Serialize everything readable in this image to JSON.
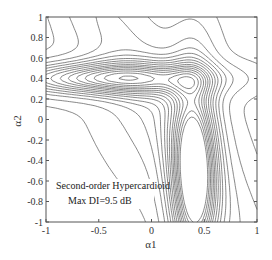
{
  "chart_data": {
    "type": "contour",
    "title": "",
    "xlabel": "α1",
    "ylabel": "α2",
    "xlim": [
      -1,
      1
    ],
    "ylim": [
      -1,
      1
    ],
    "xticks": [
      "-1",
      "-0.5",
      "0",
      "0.5",
      "1"
    ],
    "yticks": [
      "-1",
      "-0.8",
      "-0.6",
      "-0.4",
      "-0.2",
      "0",
      "0.2",
      "0.4",
      "0.6",
      "0.8",
      "1"
    ],
    "grid": false,
    "annotations": [
      {
        "text": "Second-order Hypercardioid",
        "x": -0.55,
        "y": -0.7
      },
      {
        "text": "Max DI=9.5 dB",
        "x": -0.55,
        "y": -0.88
      }
    ],
    "max_value_db": 9.5,
    "maximum_location": {
      "alpha1": 0.4,
      "alpha2": -0.6
    },
    "secondary_ridge_location": {
      "alpha1": -0.75,
      "alpha2": 0.4
    },
    "field_model": {
      "description": "Approximate directivity-index field reconstructed from contour shape",
      "peaks": [
        {
          "cx": 0.4,
          "cy": -0.55,
          "amp": 9.5,
          "sx": 0.16,
          "sy": 0.75
        },
        {
          "cx": -0.45,
          "cy": 0.4,
          "amp": 7.2,
          "sx": 0.75,
          "sy": 0.12
        }
      ],
      "levels": [
        -2,
        -1,
        0,
        1,
        2,
        2.8,
        3.5,
        4.2,
        4.8,
        5.4,
        6,
        6.5,
        7,
        7.5,
        8,
        8.5,
        9
      ]
    },
    "line_color": "#555555"
  },
  "plot": {
    "annotation_line1": "Second-order Hypercardioid",
    "annotation_line2": "Max DI=9.5 dB",
    "xlabel": "α1",
    "ylabel": "α2"
  }
}
